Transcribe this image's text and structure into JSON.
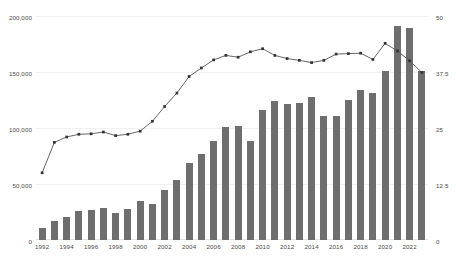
{
  "chart_data": {
    "type": "bar",
    "title": "",
    "subtitle": "",
    "xlabel": "",
    "ylabel": "",
    "grid": true,
    "legend_position": "none",
    "categories": [
      "1992",
      "1993",
      "1994",
      "1995",
      "1996",
      "1997",
      "1998",
      "1999",
      "2000",
      "2001",
      "2002",
      "2003",
      "2004",
      "2005",
      "2006",
      "2007",
      "2008",
      "2009",
      "2010",
      "2011",
      "2012",
      "2013",
      "2014",
      "2015",
      "2016",
      "2017",
      "2018",
      "2019",
      "2020",
      "2021",
      "2022",
      "2023"
    ],
    "x_tick_labels": [
      "1992",
      "1994",
      "1996",
      "1998",
      "2000",
      "2002",
      "2004",
      "2006",
      "2008",
      "2010",
      "2012",
      "2014",
      "2016",
      "2018",
      "2020",
      "2022"
    ],
    "left_axis": {
      "ticks": [
        "0",
        "50,000",
        "100,000",
        "150,000",
        "200,000"
      ],
      "tick_values": [
        0,
        50000,
        100000,
        150000,
        200000
      ],
      "ylim": [
        0,
        200000
      ],
      "series_name": "bars"
    },
    "right_axis": {
      "ticks": [
        "0",
        "12.5",
        "25",
        "37.5",
        "50"
      ],
      "tick_values": [
        0,
        12.5,
        25,
        37.5,
        50
      ],
      "ylim": [
        0,
        50
      ],
      "series_name": "line"
    },
    "series": [
      {
        "name": "bars",
        "type": "bar",
        "axis": "left",
        "color": "#6e6e6e",
        "values": [
          11000,
          17000,
          20500,
          26000,
          26500,
          29000,
          24500,
          28000,
          34500,
          32500,
          44500,
          53500,
          68500,
          76500,
          88000,
          100500,
          101500,
          88500,
          116000,
          124500,
          121500,
          122500,
          127500,
          110500,
          111000,
          125000,
          133500,
          131000,
          150500,
          191000,
          189500,
          151000
        ]
      },
      {
        "name": "line",
        "type": "line",
        "axis": "right",
        "color": "#555555",
        "marker": "square",
        "values": [
          15.0,
          21.8,
          23.0,
          23.6,
          23.7,
          24.1,
          23.3,
          23.6,
          24.3,
          26.5,
          29.8,
          32.8,
          36.5,
          38.4,
          40.2,
          41.2,
          40.8,
          42.0,
          42.7,
          41.2,
          40.5,
          40.1,
          39.6,
          40.1,
          41.5,
          41.6,
          41.7,
          40.3,
          43.9,
          42.2,
          40.0,
          37.4
        ]
      }
    ]
  }
}
